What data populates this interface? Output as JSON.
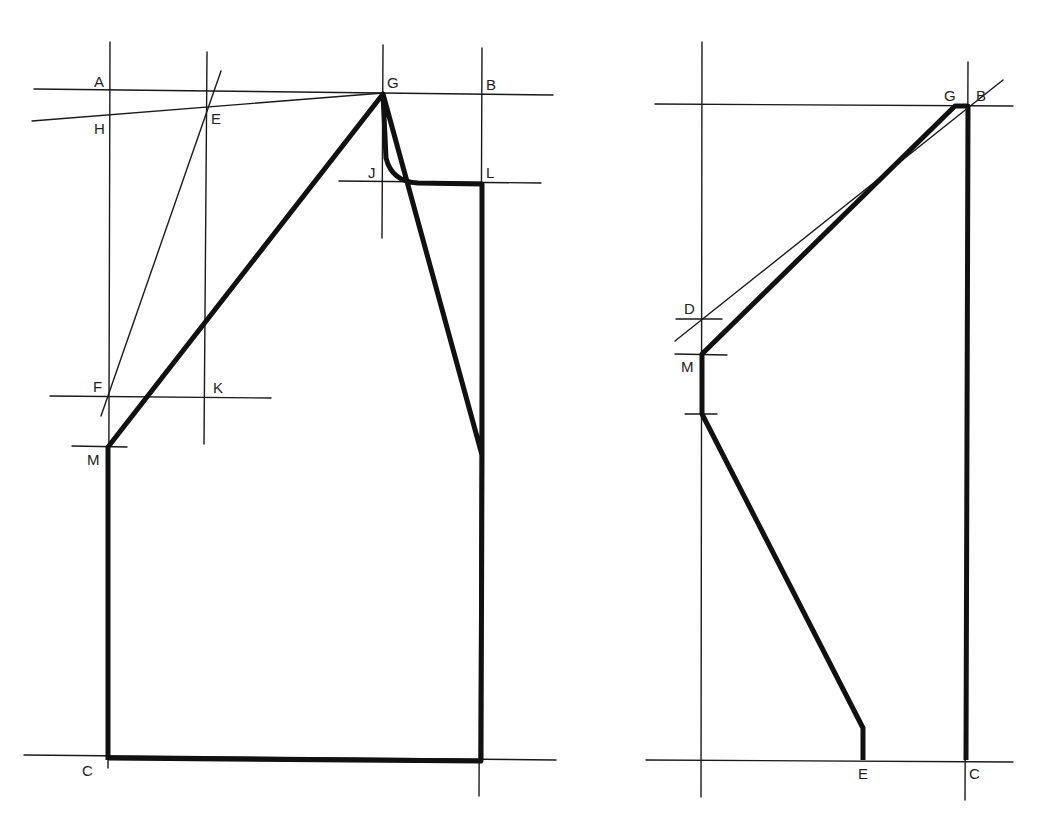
{
  "figure": {
    "type": "pattern drafting construction diagram",
    "colors": {
      "ink": "#111111",
      "background": "#ffffff"
    }
  },
  "left_diagram": {
    "labels": {
      "A": "A",
      "B": "B",
      "C": "C",
      "E": "E",
      "F": "F",
      "G": "G",
      "H": "H",
      "J": "J",
      "K": "K",
      "L": "L",
      "M": "M"
    }
  },
  "right_diagram": {
    "labels": {
      "G": "G",
      "B": "B",
      "D": "D",
      "M": "M",
      "E": "E",
      "C": "C"
    }
  }
}
